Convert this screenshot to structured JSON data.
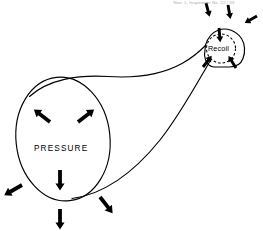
{
  "figure": {
    "title_caption": "Nov. 1, Inspiration No. 22 | 33",
    "type": "line-diagram",
    "background_color": "#ffffff",
    "ink_color": "#000000",
    "labels": {
      "pressure": "PRESSURE",
      "recoil": "Recoil"
    },
    "regions": [
      {
        "name": "pressure-chamber",
        "label": "PRESSURE",
        "shape": "ellipse",
        "center": [
          63,
          138
        ],
        "radii": [
          47,
          62
        ],
        "description": "Large oval chamber on the left representing internal pressure"
      },
      {
        "name": "recoil-chamber",
        "label": "Recoil",
        "shape": "rounded-polygon",
        "center": [
          223,
          47
        ],
        "description": "Small rounded polygon at upper right representing elastic recoil"
      }
    ],
    "pressure_arrows": {
      "direction": "outward",
      "count": 5,
      "vectors": [
        {
          "name": "upper-left",
          "angle_deg": 222
        },
        {
          "name": "upper-right",
          "angle_deg": 318
        },
        {
          "name": "down-center",
          "angle_deg": 90
        },
        {
          "name": "lower-left-external",
          "angle_deg": 215
        },
        {
          "name": "lower-right-external",
          "angle_deg": 52
        }
      ]
    },
    "recoil_arrows": {
      "direction": "inward",
      "count": 6,
      "vectors": [
        {
          "name": "top-left-in",
          "angle_deg": 70
        },
        {
          "name": "top-center-in",
          "angle_deg": 88
        },
        {
          "name": "top-right-in",
          "angle_deg": 110
        },
        {
          "name": "right-in",
          "angle_deg": 205
        },
        {
          "name": "bottom-left-in",
          "angle_deg": 300
        },
        {
          "name": "bottom-right-in",
          "angle_deg": 245
        }
      ]
    },
    "dashed_circle": {
      "name": "recoil-dashed-circle",
      "center": [
        221,
        48
      ],
      "radius": 14.5,
      "style": "dashed"
    }
  }
}
